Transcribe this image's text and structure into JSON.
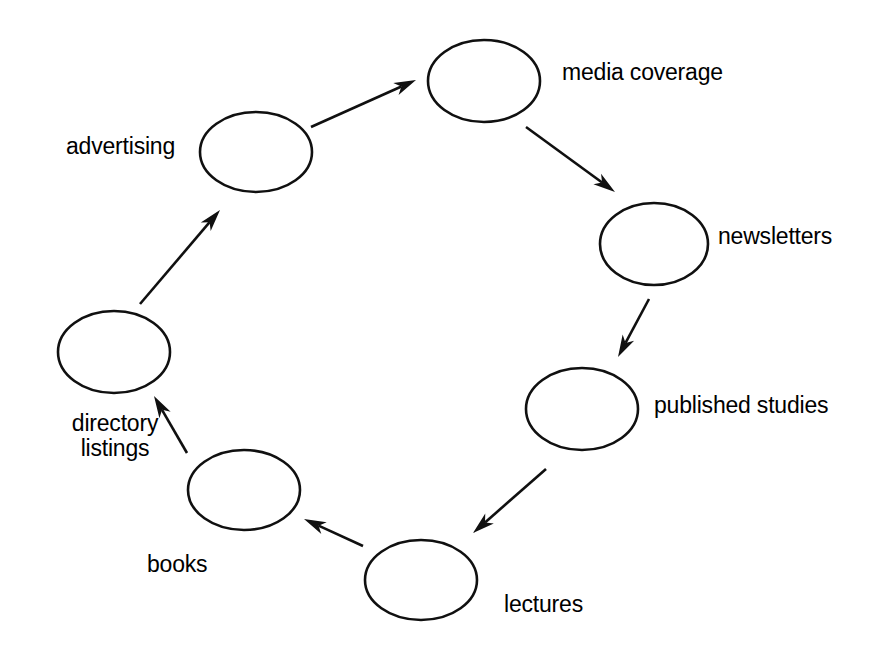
{
  "diagram": {
    "type": "cycle-diagram",
    "title": "",
    "background_color": "#ffffff",
    "stroke_color": "#101010",
    "text_color": "#000000",
    "direction": "clockwise",
    "nodes": [
      {
        "id": "media-coverage",
        "label": "media coverage",
        "shape": "ellipse",
        "cx": 484,
        "cy": 81,
        "rx": 56,
        "ry": 41,
        "label_x": 562,
        "label_y": 60,
        "label_align": "left"
      },
      {
        "id": "newsletters",
        "label": "newsletters",
        "shape": "ellipse",
        "cx": 654,
        "cy": 244,
        "rx": 54,
        "ry": 41,
        "label_x": 718,
        "label_y": 224,
        "label_align": "left"
      },
      {
        "id": "published-studies",
        "label": "published studies",
        "shape": "ellipse",
        "cx": 582,
        "cy": 409,
        "rx": 56,
        "ry": 41,
        "label_x": 654,
        "label_y": 393,
        "label_align": "left"
      },
      {
        "id": "lectures",
        "label": "lectures",
        "shape": "ellipse",
        "cx": 421,
        "cy": 580,
        "rx": 56,
        "ry": 40,
        "label_x": 504,
        "label_y": 592,
        "label_align": "left"
      },
      {
        "id": "books",
        "label": "books",
        "shape": "ellipse",
        "cx": 244,
        "cy": 490,
        "rx": 56,
        "ry": 40,
        "label_x": 147,
        "label_y": 552,
        "label_align": "left"
      },
      {
        "id": "directory-listings",
        "label": "directory\nlistings",
        "shape": "ellipse",
        "cx": 114,
        "cy": 352,
        "rx": 56,
        "ry": 41,
        "label_x": 35,
        "label_y": 411,
        "label_align": "center"
      },
      {
        "id": "advertising",
        "label": "advertising",
        "shape": "ellipse",
        "cx": 256,
        "cy": 152,
        "rx": 56,
        "ry": 40,
        "label_x": 66,
        "label_y": 134,
        "label_align": "left"
      }
    ],
    "edges": [
      {
        "id": "advertising-to-media-coverage",
        "from": "advertising",
        "to": "media-coverage",
        "x1": 311,
        "y1": 127,
        "x2": 416,
        "y2": 80
      },
      {
        "id": "media-coverage-to-newsletters",
        "from": "media-coverage",
        "to": "newsletters",
        "x1": 526,
        "y1": 127,
        "x2": 615,
        "y2": 192
      },
      {
        "id": "newsletters-to-published-studies",
        "from": "newsletters",
        "to": "published-studies",
        "x1": 649,
        "y1": 299,
        "x2": 618,
        "y2": 357
      },
      {
        "id": "published-studies-to-lectures",
        "from": "published-studies",
        "to": "lectures",
        "x1": 546,
        "y1": 469,
        "x2": 473,
        "y2": 533
      },
      {
        "id": "lectures-to-books",
        "from": "lectures",
        "to": "books",
        "x1": 363,
        "y1": 546,
        "x2": 304,
        "y2": 519
      },
      {
        "id": "books-to-directory-listings",
        "from": "books",
        "to": "directory-listings",
        "x1": 187,
        "y1": 453,
        "x2": 154,
        "y2": 396
      },
      {
        "id": "directory-listings-to-advertising",
        "from": "directory-listings",
        "to": "advertising",
        "x1": 140,
        "y1": 304,
        "x2": 220,
        "y2": 210
      }
    ]
  }
}
